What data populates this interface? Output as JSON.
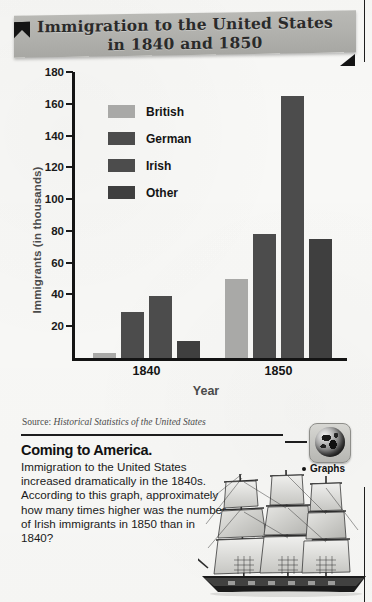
{
  "banner": {
    "title_line1": "Immigration to the United States",
    "title_line2": "in 1840 and 1850",
    "bg_color": "#b2b2ae",
    "flag_color": "#141414"
  },
  "chart_data": {
    "type": "bar",
    "title": "Immigration to the United States in 1840 and 1850",
    "xlabel": "Year",
    "ylabel": "Immigrants (in thousands)",
    "categories": [
      "1840",
      "1850"
    ],
    "series": [
      {
        "name": "British",
        "values": [
          3,
          50
        ],
        "color": "#a9a9a7"
      },
      {
        "name": "German",
        "values": [
          29,
          78
        ],
        "color": "#4c4c4c"
      },
      {
        "name": "Irish",
        "values": [
          39,
          165
        ],
        "color": "#4c4c4c"
      },
      {
        "name": "Other",
        "values": [
          11,
          75
        ],
        "color": "#3f3f3f"
      }
    ],
    "ylim": [
      0,
      180
    ],
    "yticks": [
      20,
      40,
      60,
      80,
      100,
      120,
      140,
      160,
      180
    ],
    "grid": false,
    "legend_position": "inside-top-left"
  },
  "source": {
    "prefix": "Source: ",
    "title": "Historical Statistics of the United States"
  },
  "caption": {
    "heading": "Coming to America.",
    "body": "Immigration to the United States increased dramatically in the 1840s. According to this graph, approximately how many times higher was the number of Irish immigrants in 1850 than in 1840?"
  },
  "sidebar_tag": {
    "icon": "globe-icon",
    "label": "Graphs"
  },
  "illustration": {
    "name": "sailing-ship-illustration"
  }
}
